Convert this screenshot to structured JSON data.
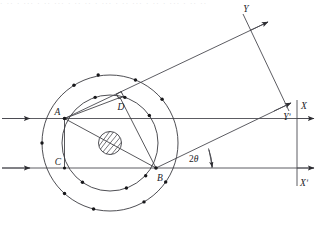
{
  "figure": {
    "kind": "optics-ray-diagram",
    "background_color": "#ffffff",
    "ink_color": "#3a3a3f",
    "label_color": "#1b1b1f",
    "width": 324,
    "height": 232,
    "scan_artifact_text": "· ·· · ··· · ·· ··· · ·· ·· · ··· · ·· ··· · ·· · ··· · ·· ··"
  },
  "labels": {
    "point_a": "A",
    "point_b": "B",
    "point_c": "C",
    "point_d": "D",
    "axis_x": "X",
    "axis_x_prime": "Xʹ",
    "axis_y": "Y",
    "axis_y_prime": "Yʹ",
    "angle_prefix": "2",
    "angle_symbol": "θ"
  },
  "geometry": {
    "center": {
      "x": 110,
      "y": 143
    },
    "outer_radius": 68,
    "inner_radius": 48,
    "core_radius": 11.5,
    "points": {
      "A": {
        "x": 64.5,
        "y": 118.5
      },
      "B": {
        "x": 156.0,
        "y": 168.0
      },
      "C": {
        "x": 64.5,
        "y": 168.0
      },
      "D": {
        "x": 120.0,
        "y": 97.5
      }
    },
    "incoming_rays_y": [
      118.5,
      168.0
    ],
    "outgoing_ray_angle_deg": -20.5,
    "vertical_axis_x": 297.0
  },
  "outer_ring_dot_angles_deg": [
    122,
    100,
    68,
    40,
    180,
    228,
    256,
    300,
    325
  ],
  "inner_ring_dot_angles_deg": [
    108,
    72,
    35,
    235,
    290,
    318
  ]
}
